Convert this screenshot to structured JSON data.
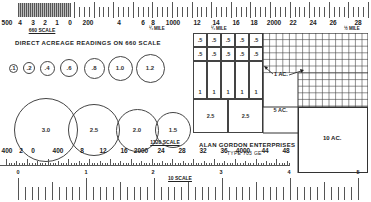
{
  "top_scale": {
    "name": "660 SCALE",
    "labels": [
      {
        "text": "500",
        "x": 7
      },
      {
        "text": "4",
        "x": 20
      },
      {
        "text": "3",
        "x": 33
      },
      {
        "text": "2",
        "x": 45
      },
      {
        "text": "1",
        "x": 57
      },
      {
        "text": "0",
        "x": 70
      },
      {
        "text": "200",
        "x": 88
      },
      {
        "text": "4",
        "x": 119
      },
      {
        "text": "6",
        "x": 143
      },
      {
        "text": "8",
        "x": 153
      },
      {
        "text": "1000",
        "x": 173
      },
      {
        "text": "12",
        "x": 197
      },
      {
        "text": "14",
        "x": 216
      },
      {
        "text": "16",
        "x": 236
      },
      {
        "text": "18",
        "x": 254
      },
      {
        "text": "2000",
        "x": 274
      },
      {
        "text": "22",
        "x": 293
      },
      {
        "text": "24",
        "x": 313
      },
      {
        "text": "26",
        "x": 333
      },
      {
        "text": "28",
        "x": 358
      }
    ],
    "mile_marks": [
      {
        "text": "¼ MILE",
        "x": 157
      },
      {
        "text": "¼ MILE",
        "x": 219
      },
      {
        "text": "½ MILE",
        "x": 352
      }
    ]
  },
  "heading": "DIRECT ACREAGE READINGS ON 660 SCALE",
  "small_circles": [
    {
      "label": ".1",
      "cx": 13,
      "d": 9
    },
    {
      "label": ".2",
      "cx": 29,
      "d": 12
    },
    {
      "label": ".4",
      "cx": 47,
      "d": 15
    },
    {
      "label": ".6",
      "cx": 69,
      "d": 18
    },
    {
      "label": ".8",
      "cx": 94,
      "d": 21
    },
    {
      "label": "1.0",
      "cx": 120,
      "d": 25
    },
    {
      "label": "1.2",
      "cx": 150,
      "d": 29
    }
  ],
  "large_circles": [
    {
      "label": "3.0",
      "cx": 46,
      "d": 64
    },
    {
      "label": "2.5",
      "cx": 94,
      "d": 52
    },
    {
      "label": "2.0",
      "cx": 137,
      "d": 43
    },
    {
      "label": "1.5",
      "cx": 173,
      "d": 36
    }
  ],
  "acre_grid": {
    "half_acre_cells": [
      ".5",
      ".5",
      ".5",
      ".5",
      ".5",
      ".5",
      ".5",
      ".5",
      ".5",
      ".5"
    ],
    "one_acre_cells": [
      "1",
      "1",
      "1",
      "1",
      "1"
    ],
    "two_half_cells": [
      "2.5",
      "2.5"
    ],
    "one_ac_label": "1 AC.",
    "five_ac_label": "5 AC.",
    "ten_ac_label": "10 AC."
  },
  "maker": {
    "name": "ALAN GORDON ENTERPRISES",
    "model": "TYPE 703 GE"
  },
  "bottom_scale": {
    "name": "1320 SCALE",
    "labels": [
      {
        "text": "400",
        "x": 7
      },
      {
        "text": "2",
        "x": 21
      },
      {
        "text": "0",
        "x": 33
      },
      {
        "text": "400",
        "x": 58
      },
      {
        "text": "8",
        "x": 82
      },
      {
        "text": "12",
        "x": 103
      },
      {
        "text": "16",
        "x": 124
      },
      {
        "text": "2000",
        "x": 141
      },
      {
        "text": "24",
        "x": 161
      },
      {
        "text": "28",
        "x": 182
      },
      {
        "text": "32",
        "x": 203
      },
      {
        "text": "36",
        "x": 224
      },
      {
        "text": "4000",
        "x": 243
      },
      {
        "text": "44",
        "x": 265
      },
      {
        "text": "48",
        "x": 286
      }
    ]
  },
  "ten_scale": {
    "name": "10 SCALE",
    "labels": [
      {
        "text": "0",
        "x": 18
      },
      {
        "text": "1",
        "x": 86
      },
      {
        "text": "2",
        "x": 153
      },
      {
        "text": "3",
        "x": 221
      },
      {
        "text": "4",
        "x": 289
      },
      {
        "text": "5",
        "x": 358
      }
    ]
  }
}
